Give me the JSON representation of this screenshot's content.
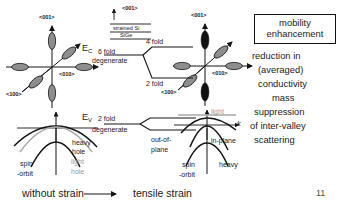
{
  "figure": {
    "page_number": "11",
    "footer": {
      "left_label": "without strain",
      "arrow": "right-arrow",
      "right_label": "tensile strain"
    }
  },
  "stack_inset": {
    "direction_label": "<001>",
    "top_layer": "strained Si",
    "bottom_layer": "SiGe"
  },
  "unstrained_conduction": {
    "axis_labels": {
      "vertical": "<001>",
      "horizontal": "<010>",
      "diagonal": "<100>"
    },
    "valley_fill": "#8e8e8e",
    "valley_count": 6
  },
  "strained_conduction": {
    "axis_labels": {
      "vertical": "<001>",
      "horizontal": "<010>",
      "diagonal": "<100>"
    },
    "in_plane_fill": "#8e8e8e",
    "out_of_plane_fill": "#111111",
    "valley_count": 6
  },
  "conduction_levels": {
    "band_edge": "E",
    "band_edge_sub": "C",
    "unsplit_line1": "6 fold",
    "unsplit_line2": "degenerate",
    "split_upper": "4 fold",
    "split_lower": "2 fold"
  },
  "valence_levels": {
    "band_edge": "E",
    "band_edge_sub": "V",
    "unsplit_line1": "2 fold",
    "unsplit_line2": "degenerate"
  },
  "unstrained_valence": {
    "heavy_line1": "heavy",
    "heavy_line2": "hole",
    "light_line1": "light",
    "light_line2": "hole",
    "spin_line1": "spin",
    "spin_line2": "-orbit",
    "light_color": "#9a9a9a"
  },
  "strained_valence": {
    "out_of_plane_line1": "out-of-",
    "out_of_plane_line2": "plane",
    "in_plane": "in-plane",
    "light": "light",
    "heavy": "heavy",
    "k_axis": "k",
    "spin_line1": "spin",
    "spin_line2": "-orbit",
    "light_color": "#9a9a9a"
  },
  "notes_panel": {
    "boxed_title_line1": "mobility",
    "boxed_title_line2": "enhancement",
    "lines": [
      "reduction in",
      "(averaged)",
      "conductivity",
      "mass",
      "suppression",
      "of inter-valley",
      "scattering"
    ]
  }
}
